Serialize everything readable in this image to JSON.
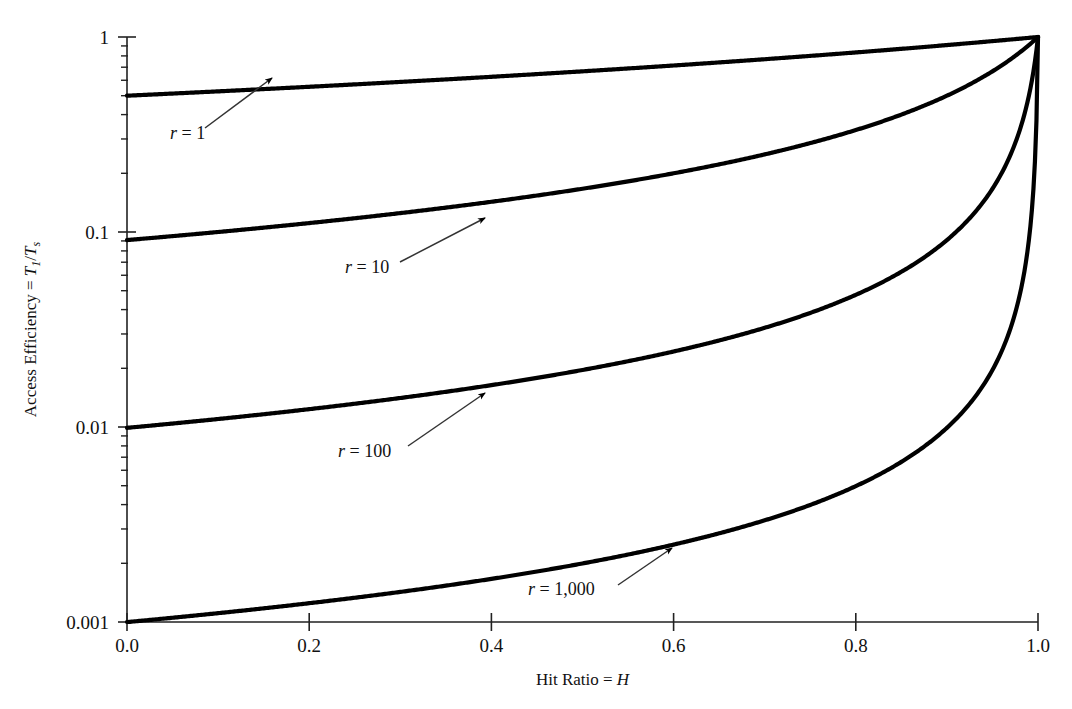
{
  "chart_data": {
    "type": "line",
    "title": "",
    "xlabel": "Hit Ratio = H",
    "ylabel": "Access Efficiency = T1/Ts",
    "ylabel_parts": {
      "prefix": "Access Efficiency = ",
      "num_var": "T",
      "num_sub": "1",
      "slash": "/",
      "den_var": "T",
      "den_sub": "s"
    },
    "xlabel_parts": {
      "prefix": "Hit Ratio = ",
      "var": "H"
    },
    "xscale": "linear",
    "yscale": "log",
    "xlim": [
      0.0,
      1.0
    ],
    "ylim": [
      0.001,
      1.0
    ],
    "grid": false,
    "legend_position": "inline-annotations",
    "xticks": [
      "0.0",
      "0.2",
      "0.4",
      "0.6",
      "0.8",
      "1.0"
    ],
    "xtick_values": [
      0.0,
      0.2,
      0.4,
      0.6,
      0.8,
      1.0
    ],
    "yticks": [
      "1",
      "0.1",
      "0.01",
      "0.001"
    ],
    "ytick_values": [
      1,
      0.1,
      0.01,
      0.001
    ],
    "y_minor_decades": [
      1,
      2,
      3,
      4,
      5,
      6,
      7,
      8,
      9
    ],
    "formula": "T1/Ts = 1 / (1 + (1 - H) * r)",
    "series": [
      {
        "name": "r = 1",
        "r": 1,
        "label_text": "r = 1",
        "label_var": "r",
        "label_rest": " = 1",
        "label_x": 170,
        "label_y": 139,
        "arrow_from": [
          205,
          128
        ],
        "arrow_to": [
          272,
          78
        ],
        "x": [
          0.0,
          0.1,
          0.2,
          0.3,
          0.4,
          0.5,
          0.6,
          0.7,
          0.8,
          0.9,
          1.0
        ],
        "values": [
          0.5,
          0.5263,
          0.5556,
          0.5882,
          0.625,
          0.6667,
          0.7143,
          0.7692,
          0.8333,
          0.9091,
          1.0
        ]
      },
      {
        "name": "r = 10",
        "r": 10,
        "label_text": "r = 10",
        "label_var": "r",
        "label_rest": " = 10",
        "label_x": 345,
        "label_y": 273,
        "arrow_from": [
          400,
          262
        ],
        "arrow_to": [
          485,
          218
        ],
        "x": [
          0.0,
          0.1,
          0.2,
          0.3,
          0.4,
          0.5,
          0.6,
          0.7,
          0.8,
          0.9,
          0.95,
          1.0
        ],
        "values": [
          0.0909,
          0.1,
          0.1111,
          0.125,
          0.1429,
          0.1667,
          0.2,
          0.25,
          0.3333,
          0.5,
          0.6667,
          1.0
        ]
      },
      {
        "name": "r = 100",
        "r": 100,
        "label_text": "r = 100",
        "label_var": "r",
        "label_rest": " = 100",
        "label_x": 338,
        "label_y": 457,
        "arrow_from": [
          408,
          446
        ],
        "arrow_to": [
          485,
          393
        ],
        "x": [
          0.0,
          0.2,
          0.4,
          0.6,
          0.8,
          0.9,
          0.95,
          0.99,
          1.0
        ],
        "values": [
          0.0099,
          0.0123,
          0.0164,
          0.0244,
          0.0476,
          0.0909,
          0.1667,
          0.5,
          1.0
        ]
      },
      {
        "name": "r = 1,000",
        "r": 1000,
        "label_text": "r = 1,000",
        "label_var": "r",
        "label_rest": " = 1,000",
        "label_x": 528,
        "label_y": 595,
        "arrow_from": [
          618,
          585
        ],
        "arrow_to": [
          672,
          548
        ],
        "x": [
          0.0,
          0.2,
          0.4,
          0.6,
          0.8,
          0.9,
          0.95,
          0.99,
          0.999,
          1.0
        ],
        "values": [
          0.001,
          0.00125,
          0.00166,
          0.0025,
          0.005,
          0.0099,
          0.0196,
          0.0909,
          0.5,
          1.0
        ]
      }
    ]
  },
  "plot": {
    "left": 127,
    "right": 1038,
    "top": 37,
    "bottom": 622,
    "line_color": "#000000",
    "axis_color": "#222222",
    "annotation_color": "#333333",
    "background": "#ffffff"
  }
}
